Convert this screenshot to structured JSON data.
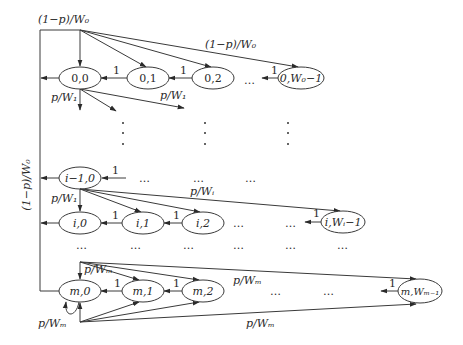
{
  "diagram": {
    "type": "markov-chain",
    "nodes": {
      "n00": "0,0",
      "n01": "0,1",
      "n02": "0,2",
      "n0W": "0,W₀−1",
      "ni10": "i−1,0",
      "ni0": "i,0",
      "ni1": "i,1",
      "ni2": "i,2",
      "niW": "i,Wᵢ−1",
      "nm0": "m,0",
      "nm1": "m,1",
      "nm2": "m,2",
      "nmW": "m,Wₘ₋₁"
    },
    "labels": {
      "top_left": "(1−p)/W₀",
      "top_right": "(1−p)/W₀",
      "vertical": "(1−p)/W₀",
      "one": "1",
      "p_w1_a": "p/W₁",
      "p_w1_b": "p/W₁",
      "p_w1_c": "p/W₁",
      "p_wi": "p/Wᵢ",
      "p_wm_top": "p/Wₘ",
      "p_wm_mid": "p/Wₘ",
      "p_wm_bottom": "p/Wₘ",
      "p_wm_loop": "p/Wₘ",
      "ellipsis": "…",
      "vdots": "⋮"
    }
  }
}
